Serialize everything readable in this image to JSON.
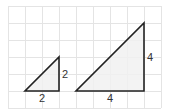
{
  "grid": {
    "origin_x": 8,
    "origin_y": 6,
    "cell": 17,
    "cols": 9,
    "rows": 6,
    "line_color": "#e4e4e4"
  },
  "colors": {
    "stroke": "#222222",
    "fill": "#f1f1f1"
  },
  "triangles": [
    {
      "name": "small-triangle",
      "points_grid": [
        [
          1,
          5
        ],
        [
          3,
          5
        ],
        [
          3,
          3
        ]
      ],
      "base_label": "2",
      "height_label": "2"
    },
    {
      "name": "large-triangle",
      "points_grid": [
        [
          4,
          5
        ],
        [
          8,
          5
        ],
        [
          8,
          1
        ]
      ],
      "base_label": "4",
      "height_label": "4"
    }
  ]
}
